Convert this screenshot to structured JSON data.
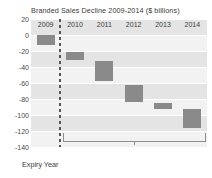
{
  "chart_data": {
    "type": "bar",
    "title": "Branded Sales Decline 2009-2014 ($ billions)",
    "subtitle": "",
    "xlabel": "Expiry Year",
    "ylabel": "",
    "ylim": [
      -140,
      20
    ],
    "grid": true,
    "legend": null,
    "categories": [
      "2009",
      "2010",
      "2011",
      "2012",
      "2013",
      "2014"
    ],
    "yticks": [
      20,
      0,
      -20,
      -40,
      -60,
      -80,
      -100,
      -120,
      -140
    ],
    "ytick_labels": [
      "20",
      "0",
      "-20",
      "-40",
      "-60",
      "-80",
      "-100",
      "-120",
      "-140"
    ],
    "series": [
      {
        "name": "Branded sales decline (cumulative waterfall)",
        "bars": [
          {
            "category": "2009",
            "top": 0,
            "bottom": -13,
            "value": -13
          },
          {
            "category": "2010",
            "top": -21,
            "bottom": -31,
            "value": -10
          },
          {
            "category": "2011",
            "top": -33,
            "bottom": -58,
            "value": -25
          },
          {
            "category": "2012",
            "top": -63,
            "bottom": -84,
            "value": -21
          },
          {
            "category": "2013",
            "top": -85,
            "bottom": -93,
            "value": -8
          },
          {
            "category": "2014",
            "top": -92,
            "bottom": -116,
            "value": -24
          }
        ]
      }
    ],
    "annotations": [
      {
        "name": "total-bracket",
        "label": "$92 billion",
        "span_categories": [
          "2010",
          "2014"
        ],
        "value": 92,
        "units": "$ billions"
      },
      {
        "name": "expiry-divider",
        "label": "",
        "style": "dashed-vertical",
        "after_category": "2009"
      }
    ]
  },
  "axis": {
    "x_caption": "Expiry Year"
  },
  "colors": {
    "bar_fill": "#8a8a8a",
    "bar_fill_light": "#9e9e9e",
    "plot_background": "#f2f2f2",
    "band": "#e4e4e4",
    "gridline": "#ffffff",
    "divider": "#555555",
    "bracket": "#8d8d8d",
    "text": "#3a3a3a"
  }
}
